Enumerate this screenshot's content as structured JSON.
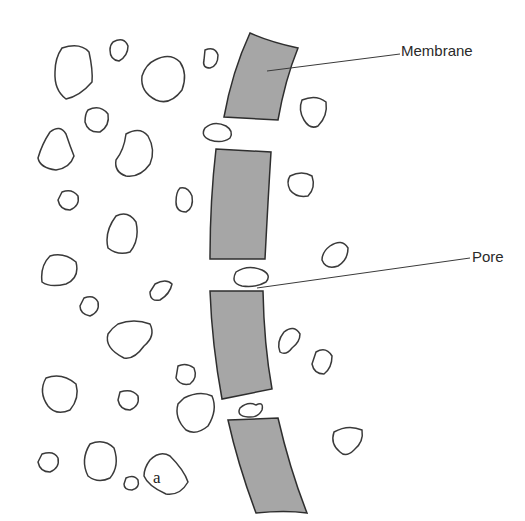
{
  "diagram": {
    "type": "membrane-pore-filtration",
    "labels": {
      "membrane": "Membrane",
      "pore": "Pore",
      "panel": "a"
    },
    "colors": {
      "membrane_fill": "#a6a6a6",
      "outline": "#2e2e2e",
      "background": "#ffffff"
    },
    "membrane_segments": 4,
    "pores": 3,
    "particles_left_side": 22,
    "particles_right_side": 8,
    "particles_in_pores": 3
  }
}
